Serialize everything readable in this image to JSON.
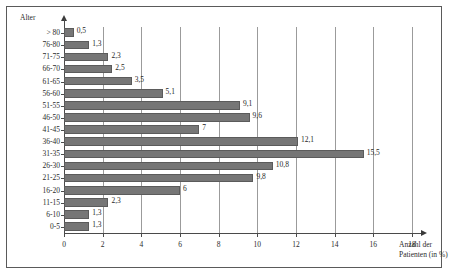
{
  "chart_data": {
    "type": "bar",
    "orientation": "horizontal",
    "title": "",
    "xlabel": "Anzahl der Patienten (in %)",
    "ylabel": "Alter",
    "xlim": [
      0,
      18
    ],
    "xticks": [
      0,
      2,
      4,
      6,
      8,
      10,
      12,
      14,
      16,
      18
    ],
    "xtick_labels": [
      "0",
      "2",
      "4",
      "6",
      "8",
      "10",
      "12",
      "14",
      "16",
      "18"
    ],
    "grid": true,
    "grid_axis": "x",
    "legend": false,
    "categories": [
      "> 80",
      "76-80",
      "71-75",
      "66-70",
      "61-65",
      "56-60",
      "51-55",
      "46-50",
      "41-45",
      "36-40",
      "31-35",
      "26-30",
      "21-25",
      "16-20",
      "11-15",
      "6-10",
      "0-5"
    ],
    "values": [
      0.5,
      1.3,
      2.3,
      2.5,
      3.5,
      5.1,
      9.1,
      9.6,
      7,
      12.1,
      15.5,
      10.8,
      9.8,
      6,
      2.3,
      1.3,
      1.3
    ],
    "value_labels": [
      "0,5",
      "1,3",
      "2,3",
      "2,5",
      "3,5",
      "5,1",
      "9,1",
      "9,6",
      "7",
      "12,1",
      "15,5",
      "10,8",
      "9,8",
      "6",
      "2,3",
      "1,3",
      "1,3"
    ],
    "bar_color": "#767676",
    "bar_edge_color": "#5b5b5b",
    "axis_color": "#4a4a4a",
    "gridline_color": "#9b9b9b"
  },
  "axis_titles": {
    "y": "Alter",
    "x_line1": "Anzahl der",
    "x_line2": "Patienten (in %)"
  }
}
